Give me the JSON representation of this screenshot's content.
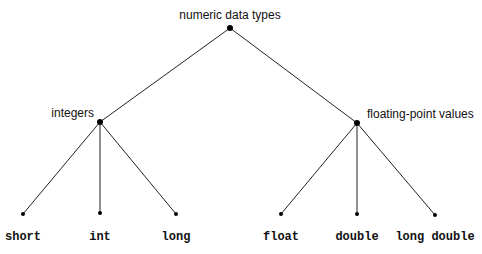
{
  "diagram": {
    "type": "tree",
    "root": {
      "id": "root",
      "label": "numeric data types",
      "x": 230,
      "y": 28,
      "lx": 230,
      "ly": 19,
      "anchor": "middle",
      "mono": false
    },
    "nodes": [
      {
        "id": "integers",
        "label": "integers",
        "parent": "root",
        "x": 100,
        "y": 122,
        "lx": 94,
        "ly": 117,
        "anchor": "end",
        "mono": false
      },
      {
        "id": "floating",
        "label": "floating-point values",
        "parent": "root",
        "x": 357,
        "y": 123,
        "lx": 367,
        "ly": 118,
        "anchor": "start",
        "mono": false
      },
      {
        "id": "short",
        "label": "short",
        "parent": "integers",
        "x": 23,
        "y": 214,
        "lx": 23,
        "ly": 240,
        "anchor": "middle",
        "mono": true
      },
      {
        "id": "int",
        "label": "int",
        "parent": "integers",
        "x": 100,
        "y": 213,
        "lx": 100,
        "ly": 240,
        "anchor": "middle",
        "mono": true
      },
      {
        "id": "long",
        "label": "long",
        "parent": "integers",
        "x": 176,
        "y": 214,
        "lx": 176,
        "ly": 240,
        "anchor": "middle",
        "mono": true
      },
      {
        "id": "float",
        "label": "float",
        "parent": "floating",
        "x": 281,
        "y": 214,
        "lx": 281,
        "ly": 240,
        "anchor": "middle",
        "mono": true
      },
      {
        "id": "double",
        "label": "double",
        "parent": "floating",
        "x": 357,
        "y": 214,
        "lx": 357,
        "ly": 240,
        "anchor": "middle",
        "mono": true
      },
      {
        "id": "longdouble",
        "label": "long double",
        "parent": "floating",
        "x": 435,
        "y": 215,
        "lx": 435,
        "ly": 240,
        "anchor": "middle",
        "mono": true
      }
    ]
  }
}
